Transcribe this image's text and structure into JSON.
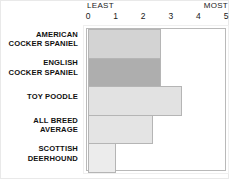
{
  "chart_data": {
    "type": "bar",
    "orientation": "horizontal",
    "title": "",
    "xlabel": "",
    "ylabel": "",
    "xlim": [
      0,
      5
    ],
    "grid": false,
    "legend": null,
    "scale_endpoints": {
      "low": "LEAST",
      "high": "MOST"
    },
    "xticks": [
      "0",
      "1",
      "2",
      "3",
      "4",
      "5"
    ],
    "categories": [
      "AMERICAN COCKER SPANIEL",
      "ENGLISH COCKER SPANIEL",
      "TOY POODLE",
      "ALL BREED AVERAGE",
      "SCOTTISH DEERHOUND"
    ],
    "values": [
      2.65,
      2.65,
      3.4,
      2.35,
      1.0
    ],
    "bar_colors": [
      "#d3d3d3",
      "#aeaeae",
      "#e2e2e2",
      "#e4e4e4",
      "#ececec"
    ],
    "highlighted_index": 1
  },
  "axis": {
    "least_label": "LEAST",
    "most_label": "MOST"
  },
  "rows": [
    {
      "line1": "AMERICAN",
      "line2": "COCKER SPANIEL"
    },
    {
      "line1": "ENGLISH",
      "line2": "COCKER SPANIEL"
    },
    {
      "line1": "TOY POODLE",
      "line2": ""
    },
    {
      "line1": "ALL BREED",
      "line2": "AVERAGE"
    },
    {
      "line1": "SCOTTISH",
      "line2": "DEERHOUND"
    }
  ]
}
